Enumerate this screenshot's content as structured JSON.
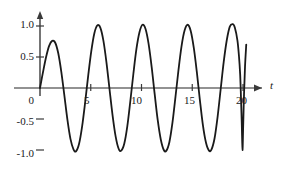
{
  "chart_data": {
    "type": "line",
    "title": "",
    "xlabel": "t",
    "ylabel": "",
    "xlim": [
      -0.6,
      24.0
    ],
    "ylim": [
      -1.25,
      1.25
    ],
    "grid": false,
    "legend": null,
    "xticks": [
      0,
      5,
      10,
      15,
      20
    ],
    "xtick_labels": [
      "0",
      "5",
      "10",
      "15",
      "20"
    ],
    "yticks": [
      1.0,
      0.5,
      -0.5,
      -1.0
    ],
    "ytick_labels": [
      "1.0",
      "0.5",
      "-0.5",
      "-1.0"
    ],
    "origin_label": "0",
    "axis_arrow": true,
    "series": [
      {
        "name": "oscillation",
        "color": "#1a1a1a",
        "line_width": 1.8,
        "x_start": 0,
        "x_end": 19.7,
        "description": "amplitude-modulated oscillation rising from 0 at t=0 to a first local maximum near 0.75, then sustained oscillation between -1.0 and 1.0 with period about 2.6, ending on a rising segment near t=19.7",
        "points": [
          {
            "x": 0.0,
            "y": 0.0
          },
          {
            "x": 0.3,
            "y": 0.26
          },
          {
            "x": 0.6,
            "y": 0.5
          },
          {
            "x": 0.9,
            "y": 0.68
          },
          {
            "x": 1.2,
            "y": 0.76
          },
          {
            "x": 1.5,
            "y": 0.73
          },
          {
            "x": 1.8,
            "y": 0.56
          },
          {
            "x": 2.1,
            "y": 0.26
          },
          {
            "x": 2.4,
            "y": -0.12
          },
          {
            "x": 2.7,
            "y": -0.51
          },
          {
            "x": 3.0,
            "y": -0.82
          },
          {
            "x": 3.3,
            "y": -0.99
          },
          {
            "x": 3.55,
            "y": -1.02
          },
          {
            "x": 3.85,
            "y": -0.9
          },
          {
            "x": 4.15,
            "y": -0.62
          },
          {
            "x": 4.45,
            "y": -0.23
          },
          {
            "x": 4.75,
            "y": 0.2
          },
          {
            "x": 5.05,
            "y": 0.59
          },
          {
            "x": 5.35,
            "y": 0.88
          },
          {
            "x": 5.65,
            "y": 1.01
          },
          {
            "x": 5.95,
            "y": 0.97
          },
          {
            "x": 6.25,
            "y": 0.76
          },
          {
            "x": 6.55,
            "y": 0.41
          },
          {
            "x": 6.85,
            "y": -0.02
          },
          {
            "x": 7.15,
            "y": -0.44
          },
          {
            "x": 7.45,
            "y": -0.78
          },
          {
            "x": 7.75,
            "y": -0.98
          },
          {
            "x": 8.0,
            "y": -1.01
          },
          {
            "x": 8.3,
            "y": -0.9
          },
          {
            "x": 8.6,
            "y": -0.62
          },
          {
            "x": 8.9,
            "y": -0.21
          },
          {
            "x": 9.2,
            "y": 0.23
          },
          {
            "x": 9.5,
            "y": 0.63
          },
          {
            "x": 9.8,
            "y": 0.9
          },
          {
            "x": 10.1,
            "y": 1.02
          },
          {
            "x": 10.4,
            "y": 0.95
          },
          {
            "x": 10.7,
            "y": 0.71
          },
          {
            "x": 11.0,
            "y": 0.34
          },
          {
            "x": 11.3,
            "y": -0.1
          },
          {
            "x": 11.6,
            "y": -0.52
          },
          {
            "x": 11.9,
            "y": -0.83
          },
          {
            "x": 12.2,
            "y": -1.0
          },
          {
            "x": 12.45,
            "y": -1.01
          },
          {
            "x": 12.75,
            "y": -0.87
          },
          {
            "x": 13.05,
            "y": -0.56
          },
          {
            "x": 13.35,
            "y": -0.14
          },
          {
            "x": 13.65,
            "y": 0.3
          },
          {
            "x": 13.95,
            "y": 0.68
          },
          {
            "x": 14.25,
            "y": 0.93
          },
          {
            "x": 14.55,
            "y": 1.02
          },
          {
            "x": 14.85,
            "y": 0.92
          },
          {
            "x": 15.15,
            "y": 0.65
          },
          {
            "x": 15.45,
            "y": 0.26
          },
          {
            "x": 15.75,
            "y": -0.19
          },
          {
            "x": 16.05,
            "y": -0.6
          },
          {
            "x": 16.35,
            "y": -0.88
          },
          {
            "x": 16.65,
            "y": -1.01
          },
          {
            "x": 16.9,
            "y": -0.99
          },
          {
            "x": 17.2,
            "y": -0.81
          },
          {
            "x": 17.5,
            "y": -0.46
          },
          {
            "x": 17.8,
            "y": -0.02
          },
          {
            "x": 18.1,
            "y": 0.42
          },
          {
            "x": 18.4,
            "y": 0.77
          },
          {
            "x": 18.7,
            "y": 0.99
          },
          {
            "x": 19.0,
            "y": 1.03
          },
          {
            "x": 19.2,
            "y": 0.97
          },
          {
            "x": 19.45,
            "y": 0.77
          },
          {
            "x": 19.6,
            "y": 0.52
          },
          {
            "x": 19.72,
            "y": 0.22
          },
          {
            "x": 19.8,
            "y": -0.15
          },
          {
            "x": 19.88,
            "y": -0.58
          },
          {
            "x": 19.95,
            "y": -1.0
          },
          {
            "x": 20.02,
            "y": -0.6
          },
          {
            "x": 20.1,
            "y": -0.1
          },
          {
            "x": 20.2,
            "y": 0.35
          },
          {
            "x": 20.32,
            "y": 0.7
          }
        ]
      }
    ]
  },
  "labels": {
    "y_1_0": "1.0",
    "y_0_5": "0.5",
    "y_0": "0",
    "y_neg_0_5": "-0.5",
    "y_neg_1_0": "-1.0",
    "x_5": "5",
    "x_10": "10",
    "x_15": "15",
    "x_20": "20",
    "axis_t": "t"
  },
  "colors": {
    "curve": "#1a1a1a",
    "axis": "#6e6e6e",
    "text": "#1a1a1a",
    "background": "#ffffff"
  }
}
